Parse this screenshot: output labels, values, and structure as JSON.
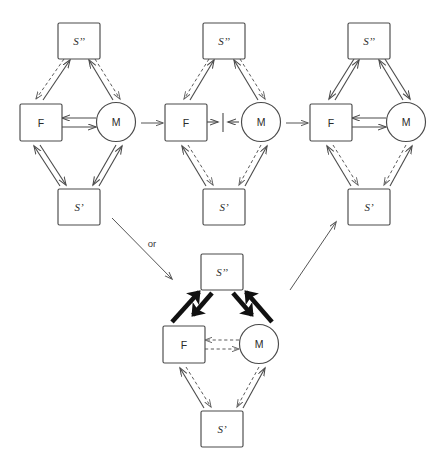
{
  "figure": {
    "kind": "state-transition-network-diagram",
    "background_color": "#ffffff",
    "line_color": "#4a4a4a",
    "bold_line_color": "#111111",
    "dashed_line_color": "#5a5a5a",
    "connector_label": "or"
  },
  "nodes": {
    "s2_label": "S’’",
    "s1_label": "S’",
    "f_label": "F",
    "m_label": "M"
  },
  "panels": [
    {
      "id": "panel-1",
      "position": "top-left",
      "nodes": [
        {
          "name": "s-double-prime",
          "shape": "square",
          "label": "S’’"
        },
        {
          "name": "f",
          "shape": "square",
          "label": "F"
        },
        {
          "name": "m",
          "shape": "circle",
          "label": "M"
        },
        {
          "name": "s-prime",
          "shape": "square",
          "label": "S’"
        }
      ],
      "edges": [
        {
          "from": "F",
          "to": "S’’",
          "style": "solid",
          "direction": "up"
        },
        {
          "from": "S’’",
          "to": "F",
          "style": "dashed",
          "direction": "down"
        },
        {
          "from": "M",
          "to": "S’’",
          "style": "solid",
          "direction": "up"
        },
        {
          "from": "S’’",
          "to": "M",
          "style": "dashed",
          "direction": "down"
        },
        {
          "from": "M",
          "to": "F",
          "style": "solid",
          "direction": "left"
        },
        {
          "from": "F",
          "to": "M",
          "style": "solid",
          "direction": "right"
        },
        {
          "from": "F",
          "to": "S’",
          "style": "solid",
          "direction": "down"
        },
        {
          "from": "S’",
          "to": "F",
          "style": "solid",
          "direction": "up"
        },
        {
          "from": "M",
          "to": "S’",
          "style": "solid",
          "direction": "down"
        },
        {
          "from": "S’",
          "to": "M",
          "style": "solid",
          "direction": "up"
        }
      ]
    },
    {
      "id": "panel-2",
      "position": "top-middle",
      "nodes": [
        {
          "name": "s-double-prime",
          "shape": "square",
          "label": "S’’"
        },
        {
          "name": "f",
          "shape": "square",
          "label": "F"
        },
        {
          "name": "m",
          "shape": "circle",
          "label": "M"
        },
        {
          "name": "s-prime",
          "shape": "square",
          "label": "S’"
        }
      ],
      "edges": [
        {
          "from": "F",
          "to": "S’’",
          "style": "solid",
          "direction": "up"
        },
        {
          "from": "S’’",
          "to": "F",
          "style": "dashed",
          "direction": "down"
        },
        {
          "from": "M",
          "to": "S’’",
          "style": "solid",
          "direction": "up"
        },
        {
          "from": "S’’",
          "to": "M",
          "style": "dashed",
          "direction": "down"
        },
        {
          "from": "F",
          "to": "M",
          "style": "blocked",
          "direction": "both",
          "symbol": "→|←"
        },
        {
          "from": "F",
          "to": "S’",
          "style": "dashed",
          "direction": "down"
        },
        {
          "from": "S’",
          "to": "F",
          "style": "solid",
          "direction": "up"
        },
        {
          "from": "M",
          "to": "S’",
          "style": "dashed",
          "direction": "down"
        },
        {
          "from": "S’",
          "to": "M",
          "style": "solid",
          "direction": "up"
        }
      ]
    },
    {
      "id": "panel-3",
      "position": "top-right",
      "nodes": [
        {
          "name": "s-double-prime",
          "shape": "square",
          "label": "S’’"
        },
        {
          "name": "f",
          "shape": "square",
          "label": "F"
        },
        {
          "name": "m",
          "shape": "circle",
          "label": "M"
        },
        {
          "name": "s-prime",
          "shape": "square",
          "label": "S’"
        }
      ],
      "edges": [
        {
          "from": "F",
          "to": "S’’",
          "style": "solid",
          "direction": "up"
        },
        {
          "from": "S’’",
          "to": "F",
          "style": "solid",
          "direction": "down"
        },
        {
          "from": "M",
          "to": "S’’",
          "style": "solid",
          "direction": "up"
        },
        {
          "from": "S’’",
          "to": "M",
          "style": "solid",
          "direction": "down"
        },
        {
          "from": "M",
          "to": "F",
          "style": "solid",
          "direction": "left"
        },
        {
          "from": "F",
          "to": "M",
          "style": "solid",
          "direction": "right"
        },
        {
          "from": "F",
          "to": "S’",
          "style": "dashed",
          "direction": "down"
        },
        {
          "from": "S’",
          "to": "F",
          "style": "solid",
          "direction": "up"
        },
        {
          "from": "M",
          "to": "S’",
          "style": "dashed",
          "direction": "down"
        },
        {
          "from": "S’",
          "to": "M",
          "style": "solid",
          "direction": "up"
        }
      ]
    },
    {
      "id": "panel-4",
      "position": "bottom-center",
      "nodes": [
        {
          "name": "s-double-prime",
          "shape": "square",
          "label": "S’’"
        },
        {
          "name": "f",
          "shape": "square",
          "label": "F"
        },
        {
          "name": "m",
          "shape": "circle",
          "label": "M"
        },
        {
          "name": "s-prime",
          "shape": "square",
          "label": "S’"
        }
      ],
      "edges": [
        {
          "from": "F",
          "to": "S’’",
          "style": "bold",
          "direction": "up"
        },
        {
          "from": "S’’",
          "to": "F",
          "style": "bold",
          "direction": "down"
        },
        {
          "from": "M",
          "to": "S’’",
          "style": "bold",
          "direction": "up"
        },
        {
          "from": "S’’",
          "to": "M",
          "style": "bold",
          "direction": "down"
        },
        {
          "from": "M",
          "to": "F",
          "style": "dashed",
          "direction": "left"
        },
        {
          "from": "F",
          "to": "M",
          "style": "dashed",
          "direction": "right"
        },
        {
          "from": "F",
          "to": "S’",
          "style": "dashed",
          "direction": "down"
        },
        {
          "from": "S’",
          "to": "F",
          "style": "solid",
          "direction": "up"
        },
        {
          "from": "M",
          "to": "S’",
          "style": "dashed",
          "direction": "down"
        },
        {
          "from": "S’",
          "to": "M",
          "style": "solid",
          "direction": "up"
        }
      ]
    }
  ],
  "transitions": [
    {
      "name": "panel1-to-panel2",
      "style": "solid-arrow",
      "direction": "right"
    },
    {
      "name": "panel2-to-panel3",
      "style": "solid-arrow",
      "direction": "right"
    },
    {
      "name": "panel1-to-panel4",
      "style": "solid-arrow",
      "direction": "down-right",
      "label": "or"
    },
    {
      "name": "panel4-to-panel3",
      "style": "solid-arrow",
      "direction": "up-right"
    }
  ]
}
